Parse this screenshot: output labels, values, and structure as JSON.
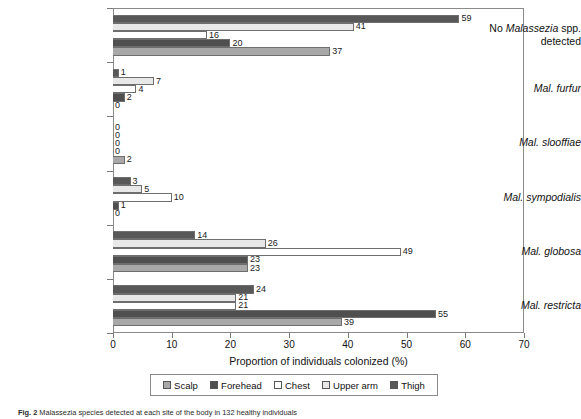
{
  "chart_data": {
    "type": "bar",
    "orientation": "horizontal",
    "title": "",
    "xlabel": "Proportion of individuals colonized (%)",
    "ylabel": "",
    "xlim": [
      0,
      70
    ],
    "xticks": [
      0,
      10,
      20,
      30,
      40,
      50,
      60,
      70
    ],
    "grid": false,
    "legend_position": "bottom",
    "categories": [
      "No Malassezia spp. detected",
      "Mal. furfur",
      "Mal. slooffiae",
      "Mal. sympodialis",
      "Mal. globosa",
      "Mal. restricta"
    ],
    "series": [
      {
        "name": "Scalp",
        "color": "#a8a8a8",
        "values": [
          37,
          0,
          2,
          0,
          23,
          39
        ]
      },
      {
        "name": "Forehead",
        "color": "#4f4f4f",
        "values": [
          20,
          2,
          0,
          1,
          23,
          55
        ]
      },
      {
        "name": "Chest",
        "color": "#ffffff",
        "values": [
          16,
          4,
          0,
          10,
          49,
          21
        ]
      },
      {
        "name": "Upper arm",
        "color": "#e8e8e8",
        "values": [
          41,
          7,
          0,
          5,
          26,
          21
        ]
      },
      {
        "name": "Thigh",
        "color": "#585858",
        "values": [
          59,
          1,
          0,
          3,
          14,
          24
        ]
      }
    ],
    "bar_order_top_to_bottom": [
      "Thigh",
      "Upper arm",
      "Chest",
      "Forehead",
      "Scalp"
    ]
  },
  "axis": {
    "x_title": "Proportion of individuals colonized (%)",
    "x_tick_labels": [
      "0",
      "10",
      "20",
      "30",
      "40",
      "50",
      "60",
      "70"
    ],
    "y_categories": [
      {
        "line1_prefix": "No ",
        "line1_italic": "Malassezia",
        "line1_suffix": " spp.",
        "line2": "detected",
        "two_line": true
      },
      {
        "text": "Mal. furfur",
        "two_line": false
      },
      {
        "text": "Mal. slooffiae",
        "two_line": false
      },
      {
        "text": "Mal. sympodialis",
        "two_line": false
      },
      {
        "text": "Mal. globosa",
        "two_line": false
      },
      {
        "text": "Mal. restricta",
        "two_line": false
      }
    ]
  },
  "legend": {
    "items": [
      {
        "label": "Scalp",
        "color": "#a8a8a8"
      },
      {
        "label": "Forehead",
        "color": "#4f4f4f"
      },
      {
        "label": "Chest",
        "color": "#ffffff"
      },
      {
        "label": "Upper arm",
        "color": "#e8e8e8"
      },
      {
        "label": "Thigh",
        "color": "#585858"
      }
    ]
  },
  "caption": {
    "figure_number": "Fig. 2",
    "text": " Malassezia species detected at each site of the body in 132 healthy individuals"
  },
  "bar_value_labels": {
    "group_0": [
      "59",
      "41",
      "16",
      "20",
      "37"
    ],
    "group_1": [
      "1",
      "7",
      "4",
      "2",
      "0"
    ],
    "group_2": [
      "0",
      "0",
      "0",
      "0",
      "2"
    ],
    "group_3": [
      "3",
      "5",
      "10",
      "1",
      "0"
    ],
    "group_4": [
      "14",
      "26",
      "49",
      "23",
      "23"
    ],
    "group_5": [
      "24",
      "21",
      "21",
      "55",
      "39"
    ]
  }
}
